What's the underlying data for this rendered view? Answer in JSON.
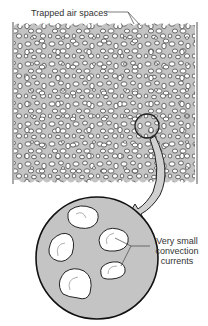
{
  "diagram": {
    "labels": {
      "trapped_air": "Trapped air spaces",
      "convection_line1": "Very small",
      "convection_line2": "convection",
      "convection_line3": "currents"
    },
    "colors": {
      "fill_gray": "#c4c4c4",
      "bubble_white": "#ffffff",
      "outline": "#222222",
      "arrow_gray": "#d0d0d0",
      "current_arrow": "#b0b0b0"
    },
    "parts": [
      "insulation-cross-section",
      "magnifier-circle",
      "magnify-arrow",
      "magnified-view",
      "convection-current-arrows"
    ]
  }
}
